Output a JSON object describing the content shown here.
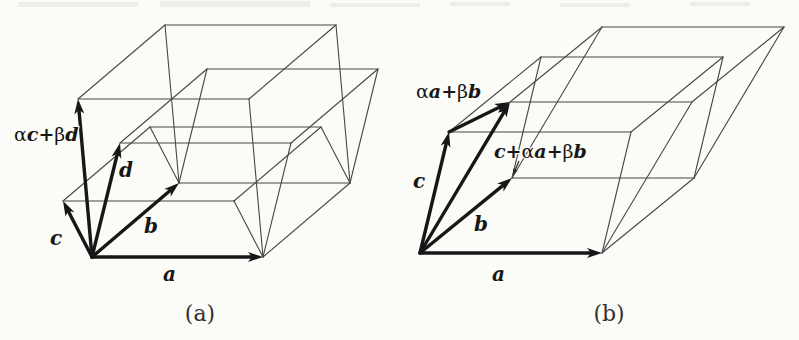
{
  "page": {
    "background": "#fbfbf8",
    "thin_line_color": "#474747",
    "thick_line_color": "#171717",
    "text_color": "#171717",
    "caption_color": "#323232"
  },
  "figures": [
    {
      "name": "parallelepiped-a",
      "caption": "(a)",
      "caption_x": 200,
      "caption_y": 321,
      "origin": [
        92,
        257
      ],
      "vectors": [
        {
          "key": "a",
          "dx": 171,
          "dy": 0,
          "thick": true,
          "label": [
            [
              "a",
              "bi"
            ]
          ],
          "lx": 163,
          "ly": 281
        },
        {
          "key": "b",
          "dx": 87,
          "dy": -74,
          "thick": true,
          "label": [
            [
              "b",
              "bi"
            ]
          ],
          "lx": 144,
          "ly": 233
        },
        {
          "key": "c",
          "dx": -29,
          "dy": -56,
          "thick": true,
          "label": [
            [
              "c",
              "bi"
            ]
          ],
          "lx": 50,
          "ly": 245
        },
        {
          "key": "d",
          "dx": 28,
          "dy": -114,
          "thick": true,
          "label": [
            [
              "d",
              "bi"
            ]
          ],
          "lx": 119,
          "ly": 177
        },
        {
          "key": "v",
          "dx": -14,
          "dy": -158,
          "thick": true,
          "label": [
            [
              "α",
              "g"
            ],
            [
              "c",
              "bi"
            ],
            [
              "+",
              "p"
            ],
            [
              "β",
              "g"
            ],
            [
              "d",
              "bi"
            ]
          ],
          "lx": 14,
          "ly": 141
        }
      ],
      "box_keys": [
        "c",
        "d",
        "v"
      ],
      "extra_arrows": [],
      "floating_labels": [],
      "leader": null
    },
    {
      "name": "parallelepiped-b",
      "caption": "(b)",
      "caption_x": 609,
      "caption_y": 321,
      "origin": [
        420,
        253
      ],
      "vectors": [
        {
          "key": "a",
          "dx": 182,
          "dy": 0,
          "thick": true,
          "label": [
            [
              "a",
              "bi"
            ]
          ],
          "lx": 492,
          "ly": 281
        },
        {
          "key": "b",
          "dx": 92,
          "dy": -75,
          "thick": true,
          "label": [
            [
              "b",
              "bi"
            ]
          ],
          "lx": 474,
          "ly": 231
        },
        {
          "key": "c",
          "dx": 29,
          "dy": -121,
          "thick": true,
          "label": [
            [
              "c",
              "bi"
            ]
          ],
          "lx": 413,
          "ly": 188
        },
        {
          "key": "w",
          "dx": 90,
          "dy": -151,
          "thick": true,
          "label": null
        }
      ],
      "box_keys": [
        "c",
        "w"
      ],
      "extra_arrows": [
        {
          "from": "c",
          "to": "w",
          "label": [
            [
              "α",
              "g"
            ],
            [
              "a",
              "bi"
            ],
            [
              "+",
              "p"
            ],
            [
              "β",
              "g"
            ],
            [
              "b",
              "bi"
            ]
          ],
          "lx": 416,
          "ly": 98
        }
      ],
      "floating_labels": [
        {
          "label": [
            [
              "c",
              "bi"
            ],
            [
              "+",
              "p"
            ],
            [
              "α",
              "g"
            ],
            [
              "a",
              "bi"
            ],
            [
              "+",
              "p"
            ],
            [
              "β",
              "g"
            ],
            [
              "b",
              "bi"
            ]
          ],
          "lx": 494,
          "ly": 158
        }
      ],
      "leader": {
        "x1": 519,
        "y1": 161,
        "x2": 513,
        "y2": 175
      }
    }
  ]
}
